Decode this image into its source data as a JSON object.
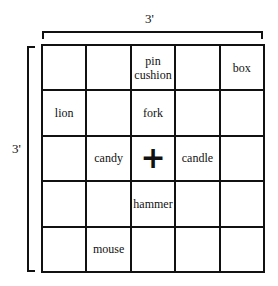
{
  "dimensions": {
    "width_label": "3'",
    "height_label": "3'"
  },
  "grid": {
    "rows": 5,
    "cols": 5,
    "cells": [
      [
        "",
        "",
        "pin\ncushion",
        "",
        "box"
      ],
      [
        "lion",
        "",
        "fork",
        "",
        ""
      ],
      [
        "",
        "candy",
        "+",
        "candle",
        ""
      ],
      [
        "",
        "",
        "hammer",
        "",
        ""
      ],
      [
        "",
        "mouse",
        "",
        "",
        ""
      ]
    ],
    "center_marker": "+"
  }
}
